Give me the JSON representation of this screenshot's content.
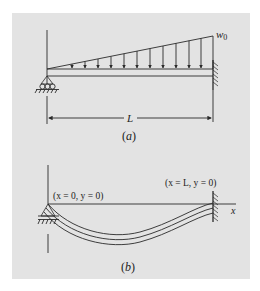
{
  "figure": {
    "background_color": "#e3e3e3",
    "line_color": "#2a2a2a",
    "panel_a": {
      "caption": "(a)",
      "load_label": "w",
      "load_subscript": "0",
      "length_label": "L",
      "arrow_count": 11
    },
    "panel_b": {
      "caption": "(b)",
      "left_boundary": "(x = 0, y = 0)",
      "right_boundary": "(x = L, y = 0)",
      "axis_label": "x"
    }
  }
}
